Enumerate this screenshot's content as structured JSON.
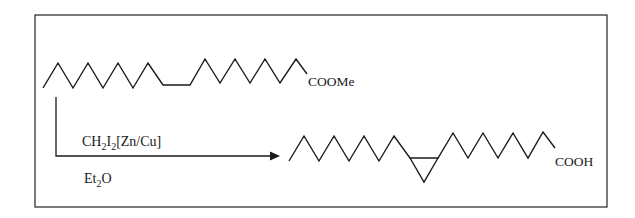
{
  "diagram": {
    "type": "reaction-scheme",
    "reactant": {
      "label": "COOMe",
      "description": "unsaturated fatty acid methyl ester (skeletal chain)"
    },
    "reagents": {
      "above_arrow": {
        "main": "CH",
        "sub1": "2",
        "mid": "I",
        "sub2": "2",
        "tail": "[Zn/Cu]"
      },
      "below_arrow": {
        "main": "Et",
        "sub": "2",
        "tail": "O"
      }
    },
    "product": {
      "label": "COOH",
      "description": "cyclopropane fatty acid (skeletal chain with cyclopropane ring)"
    },
    "colors": {
      "line": "#1a1a1a",
      "border": "#333333",
      "background": "#ffffff"
    }
  }
}
